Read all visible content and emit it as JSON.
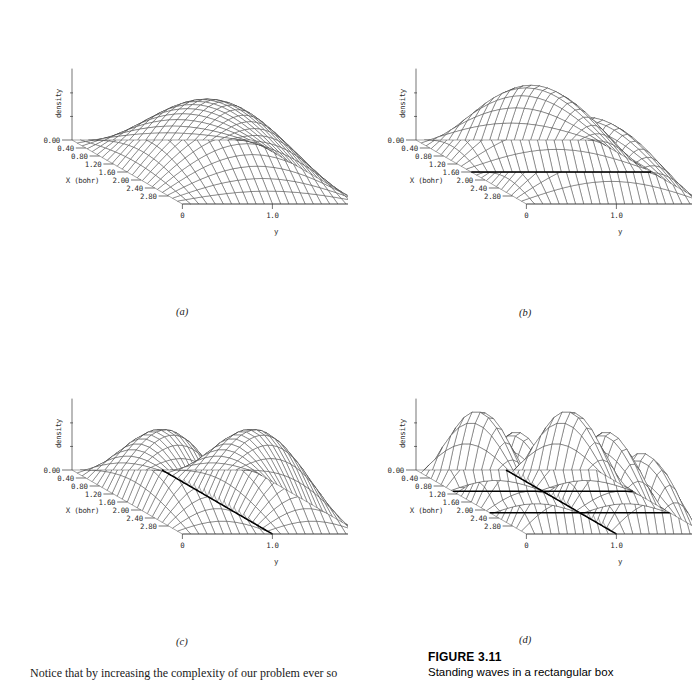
{
  "figure": {
    "caption_title": "FIGURE 3.11",
    "caption_text": "Standing waves in a rectangular box",
    "body_text": "Notice that by increasing the complexity of our problem ever so"
  },
  "axes": {
    "z_label": "density",
    "x_label": "X (bohr)",
    "y_label": "y",
    "x_ticks": [
      "0.00",
      "0.40",
      "0.80",
      "1.20",
      "1.60",
      "2.00",
      "2.40",
      "2.80"
    ],
    "y_ticks": [
      "0",
      "1.0",
      "2.0"
    ]
  },
  "panels": [
    {
      "id": "a",
      "label": "(a)",
      "nx": 1,
      "ny": 1,
      "nodes_x": [],
      "nodes_y": []
    },
    {
      "id": "b",
      "label": "(b)",
      "nx": 2,
      "ny": 1,
      "nodes_x": [
        1.6
      ],
      "nodes_y": []
    },
    {
      "id": "c",
      "label": "(c)",
      "nx": 1,
      "ny": 2,
      "nodes_x": [],
      "nodes_y": [
        1.0
      ]
    },
    {
      "id": "d",
      "label": "(d)",
      "nx": 3,
      "ny": 2,
      "nodes_x": [
        1.0667,
        2.1333
      ],
      "nodes_y": [
        1.0
      ]
    }
  ],
  "chart_data": {
    "type": "surface",
    "title": "Standing waves in a rectangular box",
    "xlabel": "X (bohr)",
    "ylabel": "y",
    "zlabel": "density",
    "xlim": [
      0.0,
      3.2
    ],
    "ylim": [
      0.0,
      2.0
    ],
    "zlim": [
      0.0,
      1.0
    ],
    "x_tick_values": [
      0.0,
      0.4,
      0.8,
      1.2,
      1.6,
      2.0,
      2.4,
      2.8
    ],
    "y_tick_values": [
      0.0,
      1.0,
      2.0
    ],
    "grid": false,
    "legend": "none",
    "projection": "oblique-wireframe",
    "mesh_nx": 22,
    "mesh_ny": 22,
    "surfaces": [
      {
        "panel": "a",
        "label": "(a)",
        "formula": "sin(1*pi*x/3.2) * sin(1*pi*y/2.0)",
        "quantum_numbers": {
          "nx": 1,
          "ny": 1
        },
        "nodal_lines_x": [],
        "nodal_lines_y": [],
        "amplitude_peak": 1.0,
        "peak_location": {
          "x": 1.6,
          "y": 1.0
        }
      },
      {
        "panel": "b",
        "label": "(b)",
        "formula": "sin(2*pi*x/3.2) * sin(1*pi*y/2.0)",
        "quantum_numbers": {
          "nx": 2,
          "ny": 1
        },
        "nodal_lines_x": [
          1.6
        ],
        "nodal_lines_y": [],
        "amplitude_peak": 1.0,
        "peak_location": {
          "x": 0.8,
          "y": 1.0
        }
      },
      {
        "panel": "c",
        "label": "(c)",
        "formula": "sin(1*pi*x/3.2) * sin(2*pi*y/2.0)",
        "quantum_numbers": {
          "nx": 1,
          "ny": 2
        },
        "nodal_lines_x": [],
        "nodal_lines_y": [
          1.0
        ],
        "amplitude_peak": 1.0,
        "peak_location": {
          "x": 1.6,
          "y": 0.5
        }
      },
      {
        "panel": "d",
        "label": "(d)",
        "formula": "sin(3*pi*x/3.2) * sin(2*pi*y/2.0)",
        "quantum_numbers": {
          "nx": 3,
          "ny": 2
        },
        "nodal_lines_x": [
          1.0667,
          2.1333
        ],
        "nodal_lines_y": [
          1.0
        ],
        "amplitude_peak": 1.0,
        "peak_location": {
          "x": 0.533,
          "y": 0.5
        }
      }
    ]
  },
  "colors": {
    "background": "#ffffff",
    "mesh": "#3a3a3a",
    "nodal_line": "#000000",
    "text": "#1a1a1a"
  }
}
